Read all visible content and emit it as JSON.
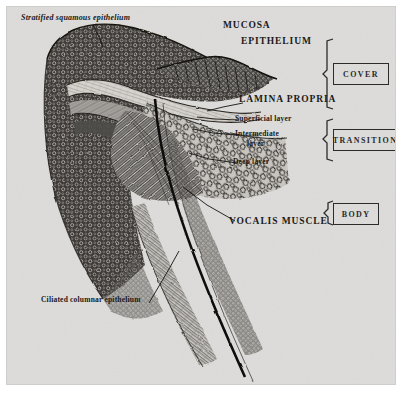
{
  "figure": {
    "title_present": false,
    "background_color": "#dddcda",
    "ink_color": "#1a1a1a",
    "frame_color": "#cfcecb"
  },
  "labels": {
    "stratified_squamous_epithelium": "Stratified squamous epithelium",
    "mucosa": "MUCOSA",
    "epithelium": "EPITHELIUM",
    "lamina_propria": "LAMINA PROPRIA",
    "superficial_layer": "Superficial layer",
    "intermediate_layer_line1": "Intermediate",
    "intermediate_layer_line2": "layer",
    "deep_layer": "Deep layer",
    "vocalis_muscle": "VOCALIS MUSCLE",
    "ciliated_columnar_epithelium": "Ciliated columnar epithelium"
  },
  "brackets": [
    {
      "name": "cover",
      "label": "COVER"
    },
    {
      "name": "transition",
      "label": "TRANSITION"
    },
    {
      "name": "body",
      "label": "BODY"
    }
  ]
}
